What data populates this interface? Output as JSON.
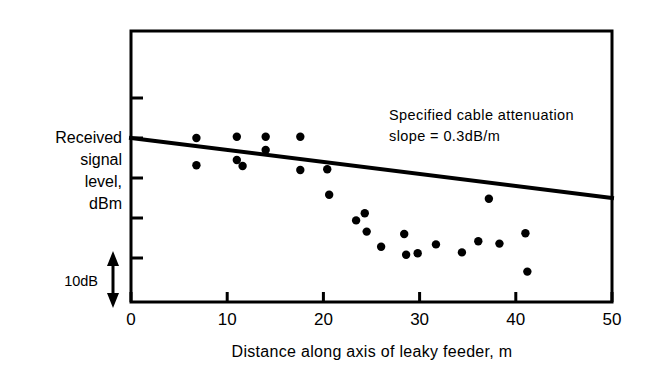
{
  "chart_data": {
    "type": "scatter",
    "title": "",
    "xlabel": "Distance along axis of leaky feeder, m",
    "ylabel": "Received signal level, dBm",
    "ylabel_lines": [
      "Received",
      "signal",
      "level,",
      "dBm"
    ],
    "xlim": [
      0,
      50
    ],
    "xticks": [
      0,
      10,
      20,
      30,
      40,
      50
    ],
    "xtick_labels": [
      "0",
      "10",
      "20",
      "30",
      "40",
      "50"
    ],
    "yticks_unlabeled": true,
    "ytick_count": 5,
    "y_axis_note": "relative scale, tick spacing = 10 dB",
    "grid": false,
    "legend": false,
    "scalebar": {
      "label": "10dB",
      "meaning": "vertical double-headed arrow spanning one 10 dB division"
    },
    "annotation": {
      "line1": "Specified cable attenuation",
      "line2": "slope  =  0.3dB/m"
    },
    "series": [
      {
        "name": "Measured received signal level",
        "marker": "filled-circle",
        "color": "#000000",
        "points": [
          {
            "x": 6.8,
            "y_rel": 0.0
          },
          {
            "x": 6.8,
            "y_rel": -6.8
          },
          {
            "x": 11.0,
            "y_rel": 0.3
          },
          {
            "x": 11.0,
            "y_rel": -5.5
          },
          {
            "x": 11.6,
            "y_rel": -7.0
          },
          {
            "x": 14.0,
            "y_rel": 0.3
          },
          {
            "x": 14.0,
            "y_rel": -3.0
          },
          {
            "x": 17.6,
            "y_rel": 0.3
          },
          {
            "x": 17.6,
            "y_rel": -8.0
          },
          {
            "x": 20.4,
            "y_rel": -7.8
          },
          {
            "x": 20.6,
            "y_rel": -14.2
          },
          {
            "x": 23.4,
            "y_rel": -20.6
          },
          {
            "x": 24.3,
            "y_rel": -18.8
          },
          {
            "x": 24.5,
            "y_rel": -23.4
          },
          {
            "x": 26.0,
            "y_rel": -27.2
          },
          {
            "x": 28.4,
            "y_rel": -24.0
          },
          {
            "x": 28.6,
            "y_rel": -29.2
          },
          {
            "x": 29.8,
            "y_rel": -28.8
          },
          {
            "x": 31.7,
            "y_rel": -26.6
          },
          {
            "x": 34.4,
            "y_rel": -28.6
          },
          {
            "x": 36.1,
            "y_rel": -25.8
          },
          {
            "x": 37.2,
            "y_rel": -15.2
          },
          {
            "x": 38.3,
            "y_rel": -26.4
          },
          {
            "x": 41.0,
            "y_rel": -23.8
          },
          {
            "x": 41.2,
            "y_rel": -33.4
          }
        ]
      }
    ],
    "fit_line": {
      "name": "Specified cable attenuation slope",
      "slope_db_per_m": -0.3,
      "x_start": 0,
      "x_end": 50,
      "y_rel_start": 0,
      "y_rel_end": -15,
      "color": "#000000"
    }
  },
  "figure": {
    "frame_color": "#000000",
    "background": "#ffffff"
  }
}
